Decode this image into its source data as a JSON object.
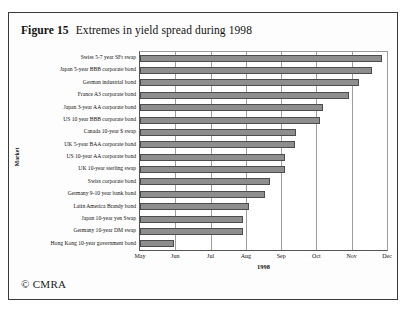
{
  "figure": {
    "number": "Figure 15",
    "title": "Extremes in yield spread during 1998",
    "copyright": "© CMRA"
  },
  "chart_data": {
    "type": "bar",
    "orientation": "horizontal",
    "title": "Extremes in yield spread during 1998",
    "xlabel": "1998",
    "ylabel": "Market",
    "grid": true,
    "legend": false,
    "xticks": [
      "May",
      "Jun",
      "Jul",
      "Aug",
      "Sep",
      "Oct",
      "Nov",
      "Dec"
    ],
    "xlim": [
      0,
      7
    ],
    "xunit": "months from May 1998",
    "categories": [
      "Swiss 5-7 year SFr swap",
      "Japan 5-year BBB corporate bond",
      "German industrial bond",
      "France A3 corporate bond",
      "Japan 3-year AA corporate bond",
      "US 10 year BBB corporate bond",
      "Canada 10-year $ swap",
      "UK 5-year BAA corporate bond",
      "US 10-year AA corporate bond",
      "UK 10-year sterling swap",
      "Swiss corporate bond",
      "Germany 9-10 year bank bond",
      "Latin America Brandy bond",
      "Japan 10-year yen Swap",
      "Germany 10-year DM swap",
      "Hong Kong 10-year government bond"
    ],
    "values": [
      6.85,
      6.57,
      6.2,
      5.91,
      5.2,
      5.09,
      4.43,
      4.4,
      4.11,
      4.11,
      3.69,
      3.54,
      3.09,
      2.91,
      2.91,
      0.97
    ]
  }
}
